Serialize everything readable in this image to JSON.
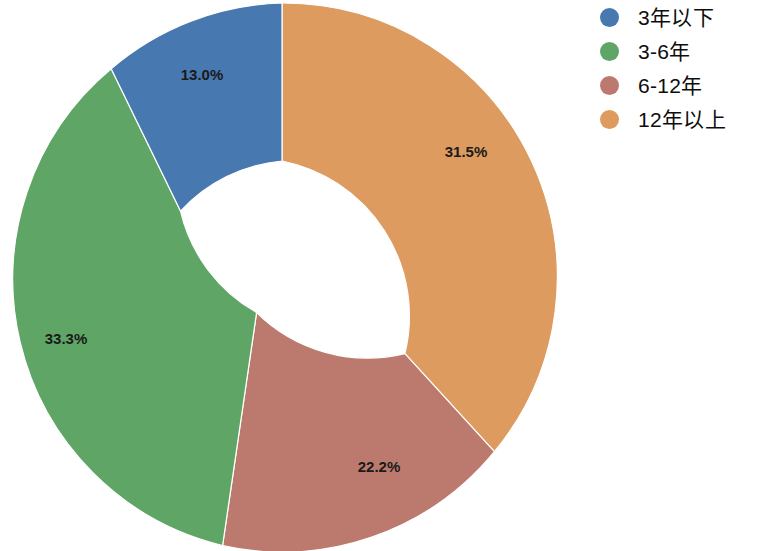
{
  "chart_data": {
    "type": "pie",
    "variant": "donut",
    "title": "",
    "subtitle": "",
    "xlabel": "",
    "ylabel": "",
    "grid": false,
    "legend_position": "right",
    "units": "%",
    "hole_ratio": 0.58,
    "start_angle_deg": 90,
    "direction": "clockwise",
    "categories": [
      "3年以下",
      "3-6年",
      "6-12年",
      "12年以上"
    ],
    "values": [
      13.0,
      33.3,
      22.2,
      31.5
    ],
    "labels": [
      "13.0%",
      "33.3%",
      "22.2%",
      "31.5%"
    ],
    "colors": [
      "#4878b0",
      "#5fa566",
      "#bc7a6e",
      "#dd9b5f"
    ],
    "draw_order": [
      {
        "name": "12年以上",
        "value": 31.5,
        "label": "31.5%",
        "color": "#dd9b5f"
      },
      {
        "name": "6-12年",
        "value": 22.2,
        "label": "22.2%",
        "color": "#bc7a6e"
      },
      {
        "name": "3-6年",
        "value": 33.3,
        "label": "33.3%",
        "color": "#5fa566"
      },
      {
        "name": "3年以下",
        "value": 13.0,
        "label": "13.0%",
        "color": "#4878b0"
      }
    ],
    "slices": [
      {
        "name": "12年以上",
        "value": 31.5,
        "label": "31.5%",
        "color": "#dd9b5f",
        "path": "M 282 3 A 274 274 0 0 1 494.4 451.7 L 404.9 353.6 A 158 158 0 0 0 282 161 Z",
        "label_x": 466,
        "label_y": 153
      },
      {
        "name": "6-12年",
        "value": 22.2,
        "label": "22.2%",
        "color": "#bc7a6e",
        "path": "M 494.4 451.7 A 274 274 0 0 1 222.6 545.5 L 256.6 312.5 A 158 158 0 0 0 404.9 353.6 Z",
        "label_x": 379,
        "label_y": 468
      },
      {
        "name": "3-6年",
        "value": 33.3,
        "label": "33.3%",
        "color": "#5fa566",
        "path": "M 222.6 545.5 A 274 274 0 0 1 111.2 68.8 L 180.5 211.1 A 158 158 0 0 0 256.6 312.5 Z",
        "label_x": 66,
        "label_y": 340
      },
      {
        "name": "3年以下",
        "value": 13.0,
        "label": "13.0%",
        "color": "#4878b0",
        "path": "M 111.2 68.8 A 274 274 0 0 1 282 3 L 282 161 A 158 158 0 0 0 180.5 211.1 Z",
        "label_x": 202,
        "label_y": 76
      }
    ],
    "center": {
      "x": 282,
      "y": 277
    },
    "outer_radius": 274,
    "inner_radius": 158,
    "background_color": "#ffffff",
    "label_text_color": "#1a1a1a"
  },
  "legend": {
    "items": [
      {
        "label": "3年以下",
        "color": "#4878b0"
      },
      {
        "label": "3-6年",
        "color": "#5fa566"
      },
      {
        "label": "6-12年",
        "color": "#bc7a6e"
      },
      {
        "label": "12年以上",
        "color": "#dd9b5f"
      }
    ]
  }
}
